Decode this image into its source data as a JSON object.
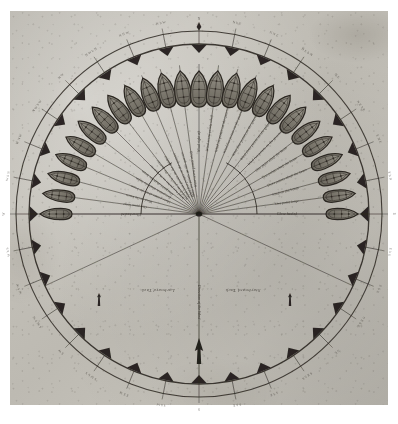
{
  "document": {
    "kind": "historical-nautical-diagram",
    "title_visible": false,
    "paper_color": "#bfbcb4",
    "ink_color": "#2b2721"
  },
  "geometry": {
    "center_x": 199,
    "center_y": 214,
    "outer_ring_radius": 183,
    "inner_ring_radius": 170,
    "ray_count": 25,
    "ray_length": 150,
    "hub_arc_radius": 58,
    "tick_count": 32
  },
  "colors": {
    "ink": "#2b2721",
    "ink_light": "#4b443b",
    "hull_fill": "#8e8a80",
    "hull_fill_dark": "#6f6b61",
    "paper": "#bfbcb4",
    "arrow": "#1d1a16"
  },
  "compass": {
    "marker_name": "wind-direction-triangle",
    "marker_count": 32,
    "edge_labels": [
      "N",
      "N b E",
      "N N E",
      "N E b N",
      "N E",
      "N E b E",
      "E N E",
      "E b N",
      "E",
      "E b S",
      "E S E",
      "S E b E",
      "S E",
      "S E b S",
      "S S E",
      "S b E",
      "S",
      "S b W",
      "S S W",
      "S W b S",
      "S W",
      "S W b W",
      "W S W",
      "W b S",
      "W",
      "W b N",
      "W N W",
      "N W b W",
      "N W",
      "N W b N",
      "N N W",
      "N b W"
    ]
  },
  "points_of_sail": {
    "heading": "Points of sail, starboard side",
    "starboard_labels": [
      "Wind right aft",
      "One point abaft the beam",
      "Two points abaft the beam",
      "Three points abaft the beam",
      "Wind on the beam",
      "One point large",
      "Close hauled"
    ],
    "larboard_labels": [
      "Wind right aft",
      "One point abaft the beam",
      "Two points abaft the beam",
      "Three points abaft the beam",
      "Wind on the beam",
      "One point large",
      "Close hauled"
    ],
    "all_ray_labels": [
      "Close hauled",
      "One point large",
      "Wind on the beam",
      "Three points abaft the beam",
      "Two points abaft the beam",
      "One point abaft the beam",
      "Wind two points on the quarter",
      "Wind three points on the quarter",
      "Wind four points on the quarter",
      "Wind five points on the quarter",
      "Wind six points on the quarter",
      "Wind seven points abaft",
      "Wind right aft",
      "Wind seven points abaft",
      "Wind six points on the quarter",
      "Wind five points on the quarter",
      "Wind four points on the quarter",
      "Wind three points on the quarter",
      "Wind two points on the quarter",
      "One point abaft the beam",
      "Two points abaft the beam",
      "Three points abaft the beam",
      "Wind on the beam",
      "One point large",
      "Close hauled"
    ]
  },
  "tack_labels": {
    "larboard": "Larboard Tack",
    "starboard": "Starboard Tack"
  },
  "wind_axis": {
    "label": "Direction of the Wind",
    "arrow_name": "wind-arrow",
    "arrow_direction": "up"
  },
  "markers": {
    "left_marker_name": "larboard-tack-marker",
    "right_marker_name": "starboard-tack-marker"
  },
  "ships": {
    "count": 25,
    "shape": "hull-plan-view",
    "name": "ship-hull"
  }
}
